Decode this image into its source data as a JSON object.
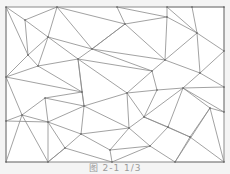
{
  "figure": {
    "caption": "图 2-1 1/3",
    "frame": {
      "x": 6,
      "y": 7,
      "width": 218,
      "height": 155
    },
    "colors": {
      "background": "#f4f4f4",
      "frame_fill": "#ffffff",
      "line": "#8a8a8a",
      "vertex": "#555555"
    },
    "vertices": [
      [
        6,
        7
      ],
      [
        57,
        7
      ],
      [
        117,
        7
      ],
      [
        167,
        7
      ],
      [
        192,
        7
      ],
      [
        224,
        7
      ],
      [
        6,
        77
      ],
      [
        6,
        121
      ],
      [
        6,
        162
      ],
      [
        48,
        162
      ],
      [
        112,
        162
      ],
      [
        175,
        162
      ],
      [
        224,
        162
      ],
      [
        224,
        51
      ],
      [
        224,
        87
      ],
      [
        224,
        112
      ],
      [
        25,
        20
      ],
      [
        28,
        55
      ],
      [
        48,
        37
      ],
      [
        78,
        59
      ],
      [
        92,
        49
      ],
      [
        125,
        24
      ],
      [
        167,
        17
      ],
      [
        197,
        33
      ],
      [
        165,
        60
      ],
      [
        200,
        73
      ],
      [
        152,
        71
      ],
      [
        157,
        90
      ],
      [
        127,
        93
      ],
      [
        183,
        88
      ],
      [
        210,
        108
      ],
      [
        84,
        106
      ],
      [
        48,
        122
      ],
      [
        22,
        115
      ],
      [
        38,
        66
      ],
      [
        144,
        117
      ],
      [
        129,
        128
      ],
      [
        81,
        134
      ],
      [
        190,
        137
      ],
      [
        150,
        146
      ],
      [
        110,
        150
      ],
      [
        65,
        148
      ],
      [
        168,
        127
      ],
      [
        45,
        98
      ],
      [
        82,
        92
      ]
    ],
    "edges": [
      [
        0,
        16
      ],
      [
        16,
        1
      ],
      [
        1,
        18
      ],
      [
        16,
        18
      ],
      [
        0,
        17
      ],
      [
        16,
        17
      ],
      [
        17,
        18
      ],
      [
        1,
        20
      ],
      [
        18,
        20
      ],
      [
        1,
        21
      ],
      [
        20,
        21
      ],
      [
        21,
        2
      ],
      [
        2,
        22
      ],
      [
        21,
        22
      ],
      [
        22,
        3
      ],
      [
        3,
        23
      ],
      [
        22,
        23
      ],
      [
        3,
        4
      ],
      [
        4,
        23
      ],
      [
        4,
        5
      ],
      [
        5,
        13
      ],
      [
        23,
        13
      ],
      [
        23,
        24
      ],
      [
        22,
        24
      ],
      [
        21,
        24
      ],
      [
        20,
        24
      ],
      [
        24,
        25
      ],
      [
        23,
        25
      ],
      [
        13,
        25
      ],
      [
        25,
        14
      ],
      [
        24,
        26
      ],
      [
        26,
        27
      ],
      [
        25,
        29
      ],
      [
        27,
        29
      ],
      [
        29,
        14
      ],
      [
        29,
        15
      ],
      [
        14,
        15
      ],
      [
        29,
        30
      ],
      [
        30,
        15
      ],
      [
        30,
        12
      ],
      [
        20,
        26
      ],
      [
        20,
        19
      ],
      [
        19,
        26
      ],
      [
        18,
        19
      ],
      [
        18,
        34
      ],
      [
        17,
        34
      ],
      [
        0,
        6
      ],
      [
        6,
        17
      ],
      [
        6,
        34
      ],
      [
        34,
        44
      ],
      [
        6,
        44
      ],
      [
        34,
        19
      ],
      [
        19,
        28
      ],
      [
        26,
        28
      ],
      [
        28,
        27
      ],
      [
        21,
        20
      ],
      [
        44,
        43
      ],
      [
        6,
        33
      ],
      [
        6,
        7
      ],
      [
        7,
        33
      ],
      [
        33,
        43
      ],
      [
        33,
        32
      ],
      [
        43,
        32
      ],
      [
        43,
        31
      ],
      [
        44,
        31
      ],
      [
        31,
        28
      ],
      [
        31,
        19
      ],
      [
        44,
        19
      ],
      [
        32,
        31
      ],
      [
        32,
        37
      ],
      [
        31,
        37
      ],
      [
        31,
        36
      ],
      [
        28,
        36
      ],
      [
        28,
        35
      ],
      [
        27,
        35
      ],
      [
        35,
        29
      ],
      [
        35,
        36
      ],
      [
        36,
        37
      ],
      [
        37,
        41
      ],
      [
        32,
        41
      ],
      [
        41,
        9
      ],
      [
        32,
        9
      ],
      [
        33,
        9
      ],
      [
        7,
        8
      ],
      [
        8,
        9
      ],
      [
        33,
        8
      ],
      [
        7,
        32
      ],
      [
        37,
        40
      ],
      [
        36,
        40
      ],
      [
        40,
        10
      ],
      [
        41,
        10
      ],
      [
        9,
        41
      ],
      [
        40,
        39
      ],
      [
        36,
        39
      ],
      [
        35,
        42
      ],
      [
        39,
        42
      ],
      [
        42,
        38
      ],
      [
        35,
        38
      ],
      [
        38,
        30
      ],
      [
        30,
        11
      ],
      [
        38,
        11
      ],
      [
        39,
        11
      ],
      [
        10,
        39
      ],
      [
        11,
        12
      ],
      [
        38,
        12
      ],
      [
        42,
        29
      ]
    ]
  }
}
